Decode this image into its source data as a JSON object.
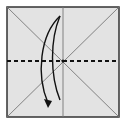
{
  "diagram": {
    "kind": "origami-fold-step",
    "paper_color": "#e3e3e3",
    "border_color": "#333333",
    "crease_color": "#777777",
    "fold_line_color": "#111111",
    "arrow_color": "#111111",
    "elements": {
      "paper": "square sheet",
      "creases": [
        "diagonal top-left to bottom-right",
        "diagonal top-right to bottom-left",
        "vertical center crease"
      ],
      "fold_line": "horizontal valley fold (dashed) through center",
      "arrow": "curved fold-and-unfold arrow, top to bottom"
    }
  }
}
